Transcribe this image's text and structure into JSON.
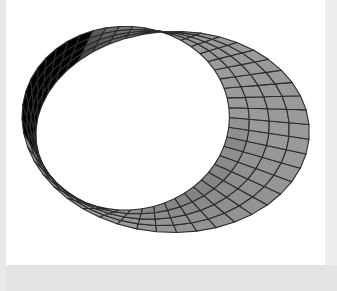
{
  "page": {
    "background_color": "#e3e3e3",
    "panel_background_color": "#ffffff"
  },
  "figure": {
    "title": "",
    "alt_name": "mobius-strip-surface-mesh",
    "caption": "",
    "surface": {
      "name": "Mobius strip",
      "render_style": "mesh",
      "mesh_line_color": "#2b2b2b",
      "face_fill_light": "#9a9a9a",
      "face_fill_mid": "#868686",
      "face_fill_dark": "#3d3d3d",
      "u_segments": 48,
      "v_segments": 4,
      "strip_radius": 1.0,
      "strip_half_width": 0.34,
      "half_twists": 1
    },
    "camera": {
      "elevation_deg": 38,
      "azimuth_deg": 20,
      "projection": "orthographic"
    }
  }
}
